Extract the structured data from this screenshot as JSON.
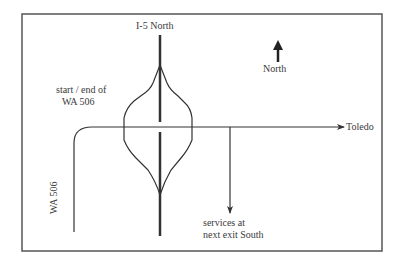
{
  "map": {
    "highway_label": "I-5 North",
    "north_label": "North",
    "start_end_label": [
      "start / end of",
      "WA 506"
    ],
    "destination_label": "Toledo",
    "services_label": [
      "services at",
      "next exit South"
    ],
    "route_label": "WA 506"
  },
  "colors": {
    "line": "#333333",
    "frame": "#555555",
    "background": "#ffffff"
  }
}
